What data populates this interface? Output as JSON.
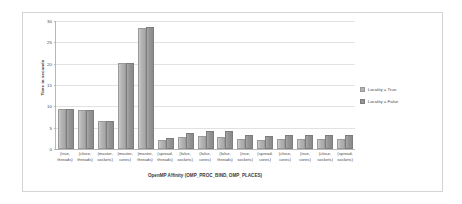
{
  "chart_data": {
    "type": "bar",
    "title": "",
    "xlabel": "OpenMP Affinity (OMP_PROC_BIND, OMP_PLACES)",
    "ylabel": "Time in seconds",
    "ylim": [
      0,
      30
    ],
    "yticks": [
      0,
      5,
      10,
      15,
      20,
      25,
      30
    ],
    "grid": true,
    "legend_position": "right",
    "categories": [
      "(true, threads)",
      "(close, threads)",
      "(master, sockets)",
      "(master, cores)",
      "(master, threads)",
      "(spread, threads)",
      "(false, sockets)",
      "(false, cores)",
      "(false, threads)",
      "(true, sockets)",
      "(spread, cores)",
      "(close, cores)",
      "(true, cores)",
      "(close, sockets)",
      "(spread, sockets)"
    ],
    "series": [
      {
        "name": "Locality = True",
        "color": "#b3b3b3",
        "values": [
          8.8,
          8.7,
          6.2,
          19.7,
          28.0,
          1.6,
          2.3,
          2.5,
          2.3,
          1.8,
          1.7,
          1.8,
          1.9,
          1.8,
          1.8
        ]
      },
      {
        "name": "Locality = False",
        "color": "#949494",
        "values": [
          8.8,
          8.7,
          6.0,
          19.7,
          28.1,
          2.2,
          3.2,
          3.7,
          3.7,
          2.7,
          2.6,
          2.7,
          2.7,
          2.7,
          2.9
        ]
      }
    ]
  },
  "yticklabels": [
    "30",
    "25",
    "20",
    "15",
    "10",
    "5",
    "0"
  ],
  "xticklabels": [
    [
      "(true,",
      "threads)"
    ],
    [
      "(close,",
      "threads)"
    ],
    [
      "(master,",
      "sockets)"
    ],
    [
      "(master,",
      "cores)"
    ],
    [
      "(master,",
      "threads)"
    ],
    [
      "(spread,",
      "threads)"
    ],
    [
      "(false,",
      "sockets)"
    ],
    [
      "(false,",
      "cores)"
    ],
    [
      "(false,",
      "threads)"
    ],
    [
      "(true,",
      "sockets)"
    ],
    [
      "(spread,",
      "cores)"
    ],
    [
      "(close,",
      "cores)"
    ],
    [
      "(true,",
      "cores)"
    ],
    [
      "(close,",
      "sockets)"
    ],
    [
      "(spread,",
      "sockets)"
    ]
  ]
}
